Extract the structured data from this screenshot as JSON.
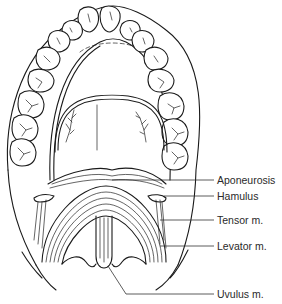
{
  "figure": {
    "labels": [
      {
        "id": "aponeurosis",
        "text": "Aponeurosis"
      },
      {
        "id": "hamulus",
        "text": "Hamulus"
      },
      {
        "id": "tensor",
        "text": "Tensor m."
      },
      {
        "id": "levator",
        "text": "Levator m."
      },
      {
        "id": "uvulus",
        "text": "Uvulus m."
      }
    ]
  }
}
